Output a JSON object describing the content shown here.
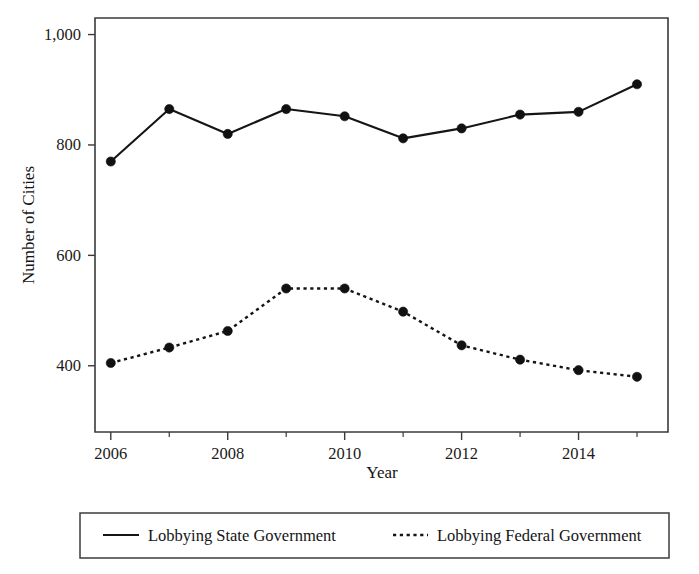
{
  "chart_data": {
    "type": "line",
    "title": "",
    "subtitle": "",
    "xlabel": "Year",
    "ylabel": "Number of Cities",
    "x": [
      2006,
      2007,
      2008,
      2009,
      2010,
      2011,
      2012,
      2013,
      2014,
      2015
    ],
    "xlim": [
      2005.73,
      2015.53
    ],
    "ylim": [
      280,
      1030
    ],
    "xticks": [
      2006,
      2008,
      2010,
      2012,
      2014
    ],
    "xtick_labels": [
      "2006",
      "2008",
      "2010",
      "2012",
      "2014"
    ],
    "xticks_minor": [
      2007,
      2009,
      2011,
      2013,
      2015
    ],
    "yticks": [
      400,
      600,
      800,
      1000
    ],
    "ytick_labels": [
      "400",
      "600",
      "800",
      "1,000"
    ],
    "grid": false,
    "legend_position": "below-outside",
    "series": [
      {
        "name": "Lobbying State Government",
        "style": "solid",
        "marker": "circle",
        "color": "#151515",
        "values": [
          770,
          865,
          820,
          865,
          852,
          812,
          830,
          855,
          860,
          910
        ]
      },
      {
        "name": "Lobbying Federal Government",
        "style": "dotted",
        "marker": "circle",
        "color": "#151515",
        "values": [
          405,
          433,
          463,
          540,
          540,
          498,
          437,
          411,
          392,
          380
        ]
      }
    ]
  },
  "legend": {
    "entries": [
      {
        "label": "Lobbying State Government",
        "style": "solid"
      },
      {
        "label": "Lobbying Federal Government",
        "style": "dotted"
      }
    ]
  },
  "axes": {
    "x_title": "Year",
    "y_title": "Number of Cities"
  },
  "colors": {
    "ink": "#151515",
    "frame": "#3a3a3a",
    "background": "#ffffff"
  }
}
